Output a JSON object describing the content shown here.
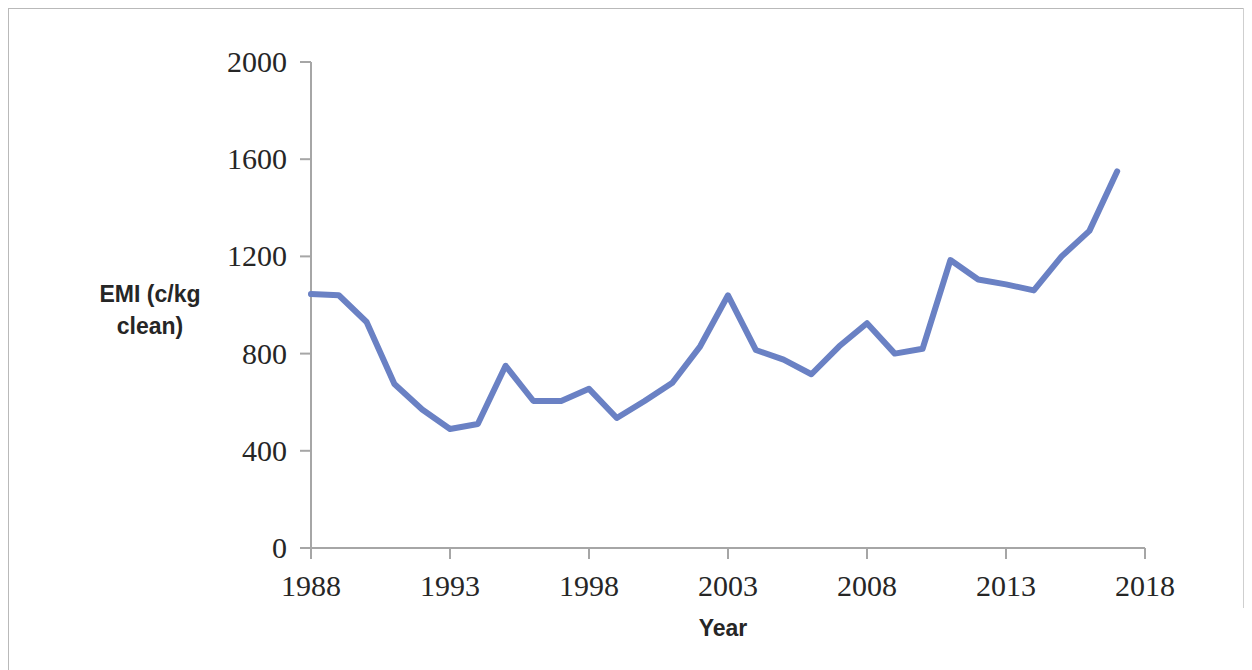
{
  "figure": {
    "background_color": "#ffffff",
    "frame_color": "#b9b9b9",
    "axis_color": "#a6a6a6",
    "text_color": "#262626"
  },
  "axis_titles": {
    "y_line1": "EMI (c/kg",
    "y_line2": "clean)",
    "x": "Year"
  },
  "y_ticks": [
    "0",
    "400",
    "800",
    "1200",
    "1600",
    "2000"
  ],
  "x_ticks": [
    "1988",
    "1993",
    "1998",
    "2003",
    "2008",
    "2013",
    "2018"
  ],
  "chart_data": {
    "type": "line",
    "title": "",
    "xlabel": "Year",
    "ylabel": "EMI (c/kg clean)",
    "xlim": [
      1988,
      2018
    ],
    "ylim": [
      0,
      2000
    ],
    "xtick_interval": 5,
    "ytick_interval": 400,
    "grid": false,
    "legend": false,
    "line_color": "#6A81C4",
    "line_width": 6,
    "x": [
      1988,
      1989,
      1990,
      1991,
      1992,
      1993,
      1994,
      1995,
      1996,
      1997,
      1998,
      1999,
      2000,
      2001,
      2002,
      2003,
      2004,
      2005,
      2006,
      2007,
      2008,
      2009,
      2010,
      2011,
      2012,
      2013,
      2014,
      2015,
      2016,
      2017
    ],
    "values": [
      1045,
      1040,
      930,
      675,
      570,
      490,
      510,
      750,
      605,
      605,
      655,
      535,
      605,
      680,
      830,
      1040,
      815,
      775,
      715,
      830,
      925,
      800,
      820,
      1185,
      1105,
      1085,
      1060,
      1200,
      1305,
      1550
    ],
    "series": [
      {
        "name": "EMI (c/kg clean)",
        "color": "#6A81C4",
        "values": [
          1045,
          1040,
          930,
          675,
          570,
          490,
          510,
          750,
          605,
          605,
          655,
          535,
          605,
          680,
          830,
          1040,
          815,
          775,
          715,
          830,
          925,
          800,
          820,
          1185,
          1105,
          1085,
          1060,
          1200,
          1305,
          1550
        ]
      }
    ]
  }
}
